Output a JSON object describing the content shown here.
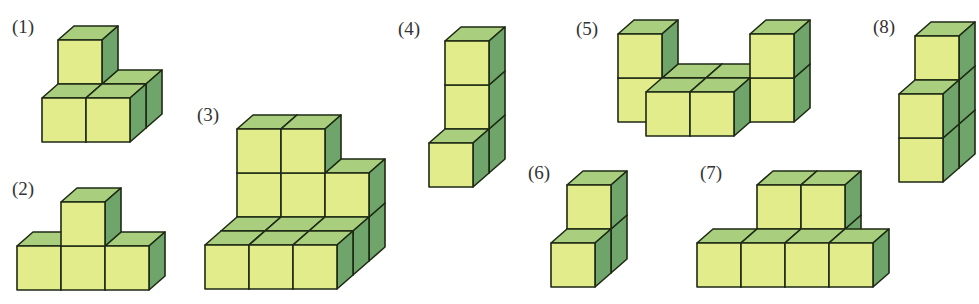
{
  "colors": {
    "front": "#e3ec8a",
    "top": "#a9cf7e",
    "side": "#6fa56a",
    "stroke": "#1e2a14"
  },
  "cube": {
    "size": 44,
    "dx": 16,
    "dy": -14
  },
  "figures": [
    {
      "label": "(1)",
      "label_pos": [
        12,
        16
      ],
      "origin": [
        42,
        142
      ],
      "cubes": [
        [
          0,
          1,
          0
        ],
        [
          1,
          1,
          0
        ],
        [
          0,
          1,
          1
        ],
        [
          0,
          0,
          0
        ],
        [
          1,
          0,
          0
        ]
      ]
    },
    {
      "label": "(2)",
      "label_pos": [
        12,
        178
      ],
      "origin": [
        17,
        290
      ],
      "cubes": [
        [
          0,
          0,
          0
        ],
        [
          1,
          0,
          0
        ],
        [
          2,
          0,
          0
        ],
        [
          1,
          0,
          1
        ]
      ]
    },
    {
      "label": "(3)",
      "label_pos": [
        197,
        104
      ],
      "origin": [
        205,
        289
      ],
      "cubes": [
        [
          0,
          2,
          0
        ],
        [
          1,
          2,
          0
        ],
        [
          2,
          2,
          0
        ],
        [
          0,
          2,
          1
        ],
        [
          1,
          2,
          1
        ],
        [
          2,
          2,
          1
        ],
        [
          0,
          2,
          2
        ],
        [
          1,
          2,
          2
        ],
        [
          0,
          1,
          0
        ],
        [
          1,
          1,
          0
        ],
        [
          2,
          1,
          0
        ],
        [
          0,
          0,
          0
        ],
        [
          1,
          0,
          0
        ],
        [
          2,
          0,
          0
        ]
      ]
    },
    {
      "label": "(4)",
      "label_pos": [
        398,
        18
      ],
      "origin": [
        429,
        187
      ],
      "cubes": [
        [
          0,
          1,
          0
        ],
        [
          0,
          1,
          1
        ],
        [
          0,
          1,
          2
        ],
        [
          0,
          0,
          0
        ]
      ]
    },
    {
      "label": "(5)",
      "label_pos": [
        576,
        18
      ],
      "origin": [
        618,
        122
      ],
      "cubes": [
        [
          0,
          0,
          0
        ],
        [
          0,
          0,
          1
        ],
        [
          1,
          0,
          0
        ],
        [
          2,
          0,
          0
        ],
        [
          3,
          0,
          0
        ],
        [
          3,
          0,
          1
        ],
        [
          1,
          -1,
          0
        ],
        [
          2,
          -1,
          0
        ]
      ]
    },
    {
      "label": "(6)",
      "label_pos": [
        528,
        162
      ],
      "origin": [
        551,
        287
      ],
      "cubes": [
        [
          0,
          1,
          0
        ],
        [
          0,
          1,
          1
        ],
        [
          0,
          0,
          0
        ]
      ]
    },
    {
      "label": "(7)",
      "label_pos": [
        700,
        162
      ],
      "origin": [
        697,
        287
      ],
      "cubes": [
        [
          1,
          1,
          0
        ],
        [
          2,
          1,
          0
        ],
        [
          1,
          1,
          1
        ],
        [
          2,
          1,
          1
        ],
        [
          0,
          0,
          0
        ],
        [
          1,
          0,
          0
        ],
        [
          2,
          0,
          0
        ],
        [
          3,
          0,
          0
        ]
      ]
    },
    {
      "label": "(8)",
      "label_pos": [
        873,
        16
      ],
      "origin": [
        899,
        182
      ],
      "cubes": [
        [
          0,
          1,
          0
        ],
        [
          0,
          1,
          1
        ],
        [
          0,
          1,
          2
        ],
        [
          0,
          0,
          0
        ],
        [
          0,
          0,
          1
        ]
      ]
    }
  ]
}
